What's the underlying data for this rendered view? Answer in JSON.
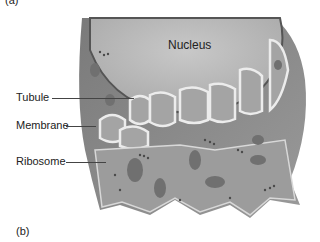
{
  "figure": {
    "panel_top_label": "(a)",
    "panel_label": "(b)",
    "labels": {
      "nucleus": "Nucleus",
      "tubule": "Tubule",
      "membrane": "Membrane",
      "ribosome": "Ribosome"
    },
    "colors": {
      "nucleus": "#b8b8b8",
      "cytoplasm": "#8a8a8a",
      "er": "#a9a9a9",
      "er_edge": "#e8e8e8",
      "cell_dark": "#6f6f6f"
    }
  }
}
